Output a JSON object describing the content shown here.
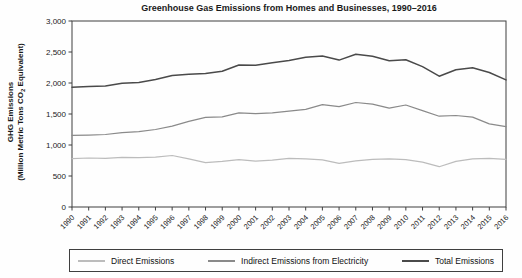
{
  "title": "Greenhouse Gas Emissions from Homes and Businesses, 1990–2016",
  "y_axis": {
    "title_line1": "GHG Emissions",
    "title_line2_prefix": "(Million Metric Tons CO",
    "title_line2_sub": "2",
    "title_line2_suffix": " Equivalent)"
  },
  "colors": {
    "axis": "#3f3f3f",
    "text": "#1a1a1a",
    "background": "#fefefe",
    "direct_line": "#bcbcbc",
    "indirect_line": "#8a8a8a",
    "total_line": "#4a4a4a"
  },
  "legend": {
    "items": [
      {
        "label": "Direct Emissions"
      },
      {
        "label": "Indirect Emissions from Electricity"
      },
      {
        "label": "Total Emissions"
      }
    ]
  },
  "chart_data": {
    "type": "line",
    "title": "Greenhouse Gas Emissions from Homes and Businesses, 1990–2016",
    "xlabel": "",
    "ylabel": "GHG Emissions (Million Metric Tons CO2 Equivalent)",
    "ylim": [
      0,
      3000
    ],
    "ytick_step": 500,
    "ytick_labels": [
      "0",
      "500",
      "1,000",
      "1,500",
      "2,000",
      "2,500",
      "3,000"
    ],
    "grid": false,
    "legend_position": "bottom",
    "x": [
      1990,
      1991,
      1992,
      1993,
      1994,
      1995,
      1996,
      1997,
      1998,
      1999,
      2000,
      2001,
      2002,
      2003,
      2004,
      2005,
      2006,
      2007,
      2008,
      2009,
      2010,
      2011,
      2012,
      2013,
      2014,
      2015,
      2016
    ],
    "series": [
      {
        "name": "Direct Emissions",
        "color": "#bcbcbc",
        "values": [
          780,
          790,
          785,
          800,
          795,
          805,
          830,
          775,
          715,
          735,
          765,
          740,
          755,
          785,
          775,
          760,
          705,
          745,
          770,
          775,
          765,
          725,
          650,
          735,
          775,
          785,
          770
        ]
      },
      {
        "name": "Indirect Emissions from Electricity",
        "color": "#8a8a8a",
        "values": [
          1155,
          1160,
          1170,
          1200,
          1215,
          1250,
          1305,
          1380,
          1445,
          1455,
          1520,
          1505,
          1520,
          1545,
          1575,
          1650,
          1620,
          1685,
          1660,
          1595,
          1645,
          1555,
          1465,
          1475,
          1450,
          1340,
          1295
        ]
      },
      {
        "name": "Total Emissions",
        "color": "#4a4a4a",
        "values": [
          1930,
          1945,
          1950,
          1995,
          2010,
          2055,
          2120,
          2140,
          2155,
          2190,
          2290,
          2285,
          2325,
          2365,
          2415,
          2435,
          2370,
          2465,
          2430,
          2360,
          2375,
          2265,
          2110,
          2215,
          2245,
          2170,
          2050
        ]
      }
    ]
  }
}
